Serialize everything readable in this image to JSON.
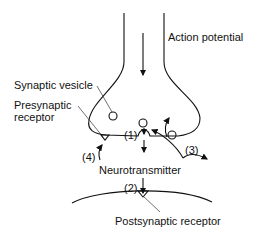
{
  "diagram": {
    "labels": {
      "action_potential": "Action potential",
      "synaptic_vesicle": "Synaptic vesicle",
      "presynaptic_receptor_1": "Presynaptic",
      "presynaptic_receptor_2": "receptor",
      "neurotransmitter": "Neurotransmitter",
      "postsynaptic_receptor": "Postsynaptic receptor",
      "step1": "(1)",
      "step2": "(2)",
      "step3": "(3)",
      "step4": "(4)"
    },
    "colors": {
      "stroke": "#111111",
      "background": "#ffffff"
    }
  }
}
